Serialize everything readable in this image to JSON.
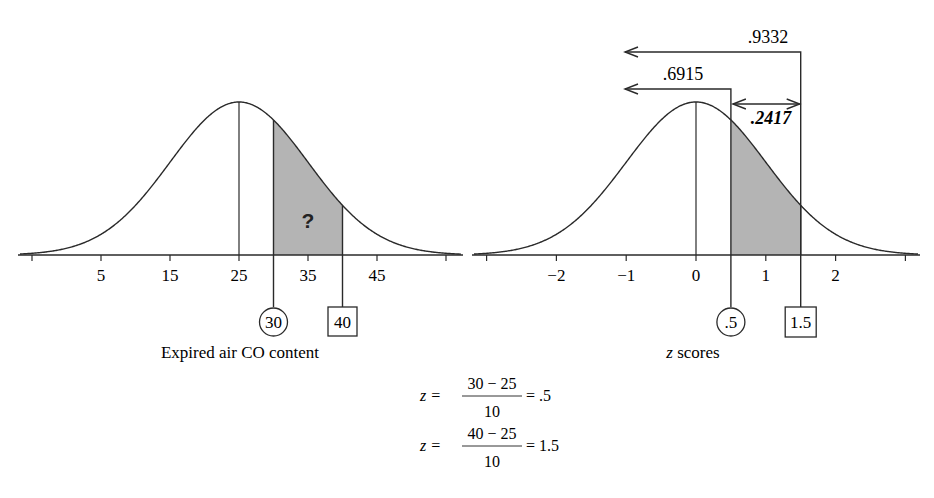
{
  "chart_data": [
    {
      "type": "area",
      "title": "",
      "xlabel": "Expired air CO content",
      "ylabel": "",
      "distribution": {
        "kind": "normal",
        "mean": 25,
        "sd": 10
      },
      "tick_values": [
        -5,
        5,
        15,
        25,
        35,
        45,
        55
      ],
      "tick_labels": [
        "",
        "5",
        "15",
        "25",
        "35",
        "45",
        ""
      ],
      "xlim": [
        -7,
        57
      ],
      "mean_line": 25,
      "shaded_region": [
        30,
        40
      ],
      "shaded_label": "?",
      "markers": [
        {
          "value": 30,
          "label": "30",
          "shape": "circle"
        },
        {
          "value": 40,
          "label": "40",
          "shape": "box"
        }
      ],
      "grid": false
    },
    {
      "type": "area",
      "title": "",
      "xlabel_italic": "z",
      "xlabel_rest": " scores",
      "xlabel": "z scores",
      "distribution": {
        "kind": "normal",
        "mean": 0,
        "sd": 1
      },
      "tick_values": [
        -3,
        -2,
        -1,
        0,
        1,
        2,
        3
      ],
      "tick_labels": [
        "",
        "−2",
        "−1",
        "0",
        "1",
        "2",
        ""
      ],
      "xlim": [
        -3.2,
        3.2
      ],
      "mean_line": 0,
      "shaded_region": [
        0.5,
        1.5
      ],
      "markers": [
        {
          "value": 0.5,
          "label": ".5",
          "shape": "circle"
        },
        {
          "value": 1.5,
          "label": "1.5",
          "shape": "box"
        }
      ],
      "annotations": [
        {
          "label": ".9332",
          "type": "cumulative-arrow",
          "to": 1.5
        },
        {
          "label": ".6915",
          "type": "cumulative-arrow",
          "to": 0.5
        },
        {
          "label": ".2417",
          "type": "difference-arrow",
          "from": 0.5,
          "to": 1.5,
          "bold_italic": true
        }
      ],
      "grid": false
    }
  ],
  "formulas": [
    {
      "lhs": "z =",
      "numerator": "30 − 25",
      "denominator": "10",
      "result": "= .5"
    },
    {
      "lhs": "z =",
      "numerator": "40 − 25",
      "denominator": "10",
      "result": "= 1.5"
    }
  ],
  "colors": {
    "shade": "#b4b4b4",
    "line": "#2a2a2a",
    "text": "#222222"
  }
}
